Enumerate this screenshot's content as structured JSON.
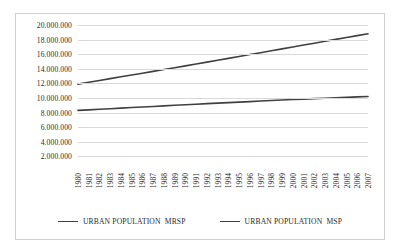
{
  "chart_data": {
    "type": "line",
    "title": "",
    "xlabel": "",
    "ylabel": "",
    "grid": true,
    "legend_position": "bottom",
    "ylim": [
      0,
      20000000
    ],
    "y_ticks": [
      "20.000.000",
      "18.000.000",
      "16.000.000",
      "14.000.000",
      "12.000.000",
      "10.000.000",
      "8.000.000",
      "6.000.000",
      "4.000.000",
      "2.000.000"
    ],
    "y_tick_values": [
      20000000,
      18000000,
      16000000,
      14000000,
      12000000,
      10000000,
      8000000,
      6000000,
      4000000,
      2000000
    ],
    "categories": [
      "1980",
      "1981",
      "1982",
      "1983",
      "1984",
      "1985",
      "1986",
      "1987",
      "1988",
      "1989",
      "1990",
      "1991",
      "1992",
      "1993",
      "1994",
      "1995",
      "1996",
      "1997",
      "1998",
      "1999",
      "2000",
      "2001",
      "2002",
      "2003",
      "2004",
      "2005",
      "2006",
      "2007"
    ],
    "series": [
      {
        "name": "URBAN POPULATION  MRSP",
        "color": "#404040",
        "values": [
          11900000,
          12150000,
          12400000,
          12650000,
          12900000,
          13150000,
          13400000,
          13650000,
          13900000,
          14150000,
          14400000,
          14650000,
          14910000,
          15170000,
          15430000,
          15690000,
          15950000,
          16210000,
          16470000,
          16730000,
          16990000,
          17250000,
          17510000,
          17770000,
          18030000,
          18290000,
          18550000,
          18800000
        ]
      },
      {
        "name": "URBAN POPULATION  MSP",
        "color": "#404040",
        "values": [
          8300000,
          8380000,
          8450000,
          8530000,
          8610000,
          8690000,
          8760000,
          8840000,
          8920000,
          9000000,
          9080000,
          9150000,
          9230000,
          9300000,
          9370000,
          9440000,
          9510000,
          9580000,
          9650000,
          9720000,
          9790000,
          9850000,
          9910000,
          9970000,
          10030000,
          10090000,
          10150000,
          10200000
        ]
      }
    ]
  },
  "legend": {
    "items": [
      {
        "label": "URBAN POPULATION  MRSP",
        "color": "#404040"
      },
      {
        "label": "URBAN POPULATION  MSP",
        "color": "#404040"
      }
    ]
  }
}
